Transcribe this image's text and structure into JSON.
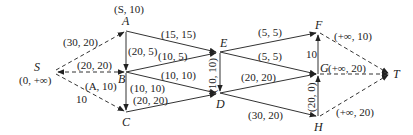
{
  "diagram": {
    "type": "network-flow",
    "nodes": [
      {
        "id": "S",
        "label": "S",
        "mark": "(0, +∞)"
      },
      {
        "id": "A",
        "label": "A",
        "mark": "(S, 10)"
      },
      {
        "id": "B",
        "label": "B",
        "mark": ""
      },
      {
        "id": "C",
        "label": "C",
        "mark": ""
      },
      {
        "id": "E",
        "label": "E",
        "mark": ""
      },
      {
        "id": "D",
        "label": "D",
        "mark": ""
      },
      {
        "id": "F",
        "label": "F",
        "mark": ""
      },
      {
        "id": "G",
        "label": "G",
        "mark": "(+∞, 20)"
      },
      {
        "id": "H",
        "label": "H",
        "mark": ""
      },
      {
        "id": "T",
        "label": "T",
        "mark": ""
      }
    ],
    "edges": [
      {
        "from": "S",
        "to": "A",
        "label": "(30, 20)",
        "style": "dashed"
      },
      {
        "from": "S",
        "to": "B",
        "label": "(20, 20)",
        "style": "dashed"
      },
      {
        "from": "S",
        "to": "C",
        "label": "10",
        "style": "dashed"
      },
      {
        "from": "S",
        "to": "C",
        "label2": "(A, 10)",
        "style": "dashed"
      },
      {
        "from": "A",
        "to": "B",
        "label": "(20, 5)",
        "style": "solid"
      },
      {
        "from": "A",
        "to": "E",
        "label": "(15, 15)",
        "style": "solid"
      },
      {
        "from": "B",
        "to": "E",
        "label": "(10, 5)",
        "style": "solid"
      },
      {
        "from": "B",
        "to": "D",
        "label": "(10, 10)",
        "style": "solid"
      },
      {
        "from": "B",
        "to": "C",
        "label": "(10, 10)",
        "style": "solid"
      },
      {
        "from": "C",
        "to": "D",
        "label": "(20, 20)",
        "style": "solid"
      },
      {
        "from": "E",
        "to": "D",
        "label": "(10, 10)",
        "style": "solid"
      },
      {
        "from": "E",
        "to": "F",
        "label": "(5, 5)",
        "style": "solid"
      },
      {
        "from": "E",
        "to": "G",
        "label": "(5, 5)",
        "style": "solid"
      },
      {
        "from": "D",
        "to": "G",
        "label": "(20, 20)",
        "style": "solid"
      },
      {
        "from": "D",
        "to": "H",
        "label": "(30, 20)",
        "style": "solid"
      },
      {
        "from": "G",
        "to": "F",
        "label": "10",
        "style": "solid"
      },
      {
        "from": "H",
        "to": "G",
        "label": "(20, 0)",
        "style": "solid"
      },
      {
        "from": "F",
        "to": "T",
        "label": "(+∞, 10)",
        "style": "dashed"
      },
      {
        "from": "G",
        "to": "T",
        "label": "",
        "style": "dashed"
      },
      {
        "from": "H",
        "to": "T",
        "label": "(+∞, 20)",
        "style": "dashed"
      }
    ]
  },
  "labels": {
    "S": "S",
    "S_mark": "(0, +∞)",
    "A": "A",
    "A_mark": "(S, 10)",
    "B": "B",
    "C": "C",
    "D": "D",
    "E": "E",
    "F": "F",
    "G": "G",
    "G_mark": "(+∞, 20)",
    "H": "H",
    "T": "T",
    "SA": "(30, 20)",
    "SB": "(20, 20)",
    "SC_cap": "10",
    "SC_mark": "(A, 10)",
    "AB": "(20, 5)",
    "AE": "(15, 15)",
    "BE": "(10, 5)",
    "BD": "(10, 10)",
    "BC": "(10, 10)",
    "CD": "(20, 20)",
    "ED": "(10, 10)",
    "EF": "(5, 5)",
    "EG": "(5, 5)",
    "DG": "(20, 20)",
    "DH": "(30, 20)",
    "GF": "10",
    "HG": "(20, 0)",
    "FT": "(+∞, 10)",
    "HT": "(+∞, 20)"
  }
}
